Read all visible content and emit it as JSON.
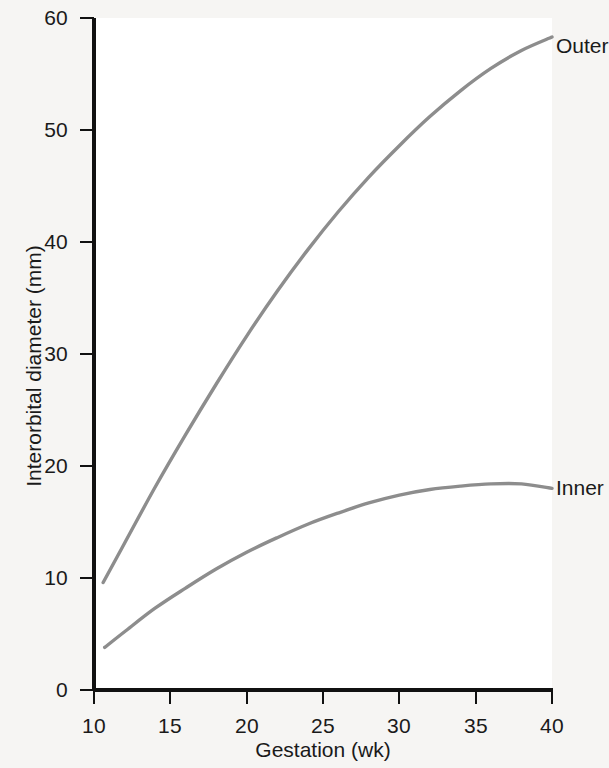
{
  "chart_data": {
    "type": "line",
    "title": "",
    "xlabel": "Gestation (wk)",
    "ylabel": "Interorbital diameter (mm)",
    "xlim": [
      10,
      40
    ],
    "ylim": [
      0,
      60
    ],
    "xticks": [
      "10",
      "15",
      "20",
      "25",
      "30",
      "35",
      "40"
    ],
    "yticks": [
      "0",
      "10",
      "20",
      "30",
      "40",
      "50",
      "60"
    ],
    "grid": false,
    "legend_position": "right-inline-labels",
    "line_color": "#8d8d8d",
    "axis_color": "#111111",
    "background_color": "#f6f5f3",
    "plot_background_color": "#ffffff",
    "series": [
      {
        "name": "Outer",
        "label": "Outer",
        "color": "#8d8d8d",
        "x": [
          10.6,
          12,
          14,
          16,
          18,
          20,
          22,
          24,
          26,
          28,
          30,
          32,
          34,
          36,
          38,
          40
        ],
        "values": [
          9.6,
          13.1,
          18.1,
          22.8,
          27.3,
          31.6,
          35.6,
          39.3,
          42.7,
          45.8,
          48.6,
          51.2,
          53.5,
          55.5,
          57.1,
          58.3
        ]
      },
      {
        "name": "Inner",
        "label": "Inner",
        "color": "#8d8d8d",
        "x": [
          10.7,
          12,
          14,
          16,
          18,
          20,
          22,
          24,
          26,
          28,
          30,
          32,
          34,
          36,
          38,
          40
        ],
        "values": [
          3.8,
          5.2,
          7.3,
          9.1,
          10.8,
          12.3,
          13.6,
          14.8,
          15.8,
          16.7,
          17.4,
          17.9,
          18.2,
          18.4,
          18.4,
          18.0
        ]
      }
    ]
  }
}
